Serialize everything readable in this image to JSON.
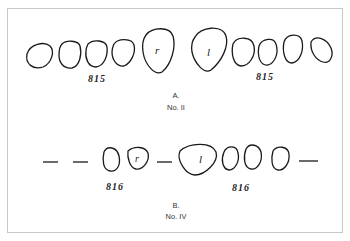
{
  "figure_a": {
    "label_left": "815",
    "label_right": "815",
    "tooth_r": "r",
    "tooth_l": "l",
    "caption_letter": "A.",
    "caption_number": "No. II"
  },
  "figure_b": {
    "label_left": "816",
    "label_right": "816",
    "tooth_r": "r",
    "tooth_l": "l",
    "caption_letter": "B.",
    "caption_number": "No. IV"
  },
  "colors": {
    "stroke": "#1a1a1a",
    "border": "#c8c8c8"
  }
}
